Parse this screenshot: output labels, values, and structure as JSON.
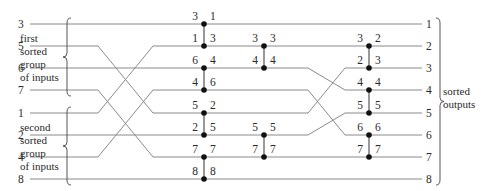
{
  "diagram": {
    "type": "merging-network",
    "labels": {
      "first_group": [
        "first",
        "sorted",
        "group",
        "of inputs"
      ],
      "second_group": [
        "second",
        "sorted",
        "group",
        "of inputs"
      ],
      "outputs": [
        "sorted",
        "outputs"
      ]
    },
    "row_y": [
      24,
      46,
      68,
      90,
      113,
      135,
      157,
      179
    ],
    "wire_start_x": 30,
    "wire_end_x": 422,
    "inputs": [
      "3",
      "5",
      "6",
      "7",
      "1",
      "2",
      "4",
      "8"
    ],
    "outputs": [
      "1",
      "2",
      "3",
      "4",
      "5",
      "6",
      "7",
      "8"
    ],
    "crossings": [
      {
        "from_x": 98,
        "to_x": 138,
        "map": [
          [
            1,
            4
          ],
          [
            4,
            1
          ],
          [
            3,
            6
          ],
          [
            6,
            3
          ]
        ]
      },
      {
        "from_x": 300,
        "to_x": 345,
        "map": [
          [
            2,
            3
          ],
          [
            3,
            5
          ],
          [
            4,
            2
          ],
          [
            5,
            4
          ]
        ]
      }
    ],
    "comparators": [
      {
        "x": 204,
        "top": 0,
        "bottom": 1,
        "in": [
          "3",
          "1"
        ],
        "out": [
          "1",
          "3"
        ]
      },
      {
        "x": 204,
        "top": 2,
        "bottom": 3,
        "in": [
          "6",
          "4"
        ],
        "out": [
          "4",
          "6"
        ]
      },
      {
        "x": 204,
        "top": 4,
        "bottom": 5,
        "in": [
          "5",
          "2"
        ],
        "out": [
          "2",
          "5"
        ]
      },
      {
        "x": 204,
        "top": 6,
        "bottom": 7,
        "in": [
          "7",
          "8"
        ],
        "out": [
          "7",
          "8"
        ]
      },
      {
        "x": 264,
        "top": 1,
        "bottom": 2,
        "in": [
          "3",
          "4"
        ],
        "out": [
          "3",
          "4"
        ]
      },
      {
        "x": 264,
        "top": 5,
        "bottom": 6,
        "in": [
          "5",
          "7"
        ],
        "out": [
          "5",
          "7"
        ]
      },
      {
        "x": 369,
        "top": 1,
        "bottom": 2,
        "in": [
          "3",
          "2"
        ],
        "out": [
          "2",
          "3"
        ]
      },
      {
        "x": 369,
        "top": 3,
        "bottom": 4,
        "in": [
          "4",
          "5"
        ],
        "out": [
          "4",
          "5"
        ]
      },
      {
        "x": 369,
        "top": 5,
        "bottom": 6,
        "in": [
          "6",
          "7"
        ],
        "out": [
          "6",
          "7"
        ]
      }
    ],
    "colors": {
      "wire": "#8a8a8a",
      "dot": "#111111",
      "text": "#2a2a2a"
    }
  }
}
